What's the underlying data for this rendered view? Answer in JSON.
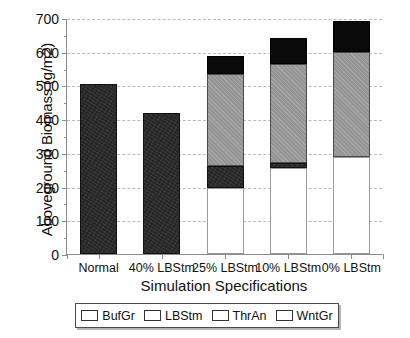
{
  "chart_data": {
    "type": "bar",
    "stacked": true,
    "title": "",
    "xlabel": "Simulation Specifications",
    "ylabel": "Aboveground Biomass (g/m2)",
    "categories": [
      "Normal",
      "40% LBStm",
      "25% LBStm",
      "10% LBStm",
      "0% LBStm"
    ],
    "ylim": [
      0,
      700
    ],
    "yticks": [
      0,
      100,
      200,
      300,
      400,
      500,
      600,
      700
    ],
    "ytick_labels": [
      "0",
      "100",
      "200",
      "300",
      "400",
      "500",
      "600",
      "700"
    ],
    "minor_ticks": true,
    "grid": "horizontal-dashed",
    "legend_position": "below",
    "series": [
      {
        "name": "BufGr",
        "color": "#ffffff",
        "values": [
          0,
          0,
          196,
          255,
          288
        ]
      },
      {
        "name": "LBStm",
        "color": "#262626",
        "values": [
          503,
          417,
          65,
          15,
          0
        ]
      },
      {
        "name": "ThrAn",
        "color": "#9c9c9c",
        "values": [
          0,
          0,
          273,
          293,
          312
        ]
      },
      {
        "name": "WntGr",
        "color": "#0a0a0a",
        "values": [
          0,
          0,
          54,
          77,
          92
        ]
      }
    ],
    "totals": [
      503,
      417,
      588,
      640,
      692
    ]
  },
  "legend": {
    "items": [
      {
        "label": "BufGr",
        "swatch": "white-swatch"
      },
      {
        "label": "LBStm",
        "swatch": "dark-swatch"
      },
      {
        "label": "ThrAn",
        "swatch": "gray-swatch"
      },
      {
        "label": "WntGr",
        "swatch": "black-swatch"
      }
    ]
  }
}
